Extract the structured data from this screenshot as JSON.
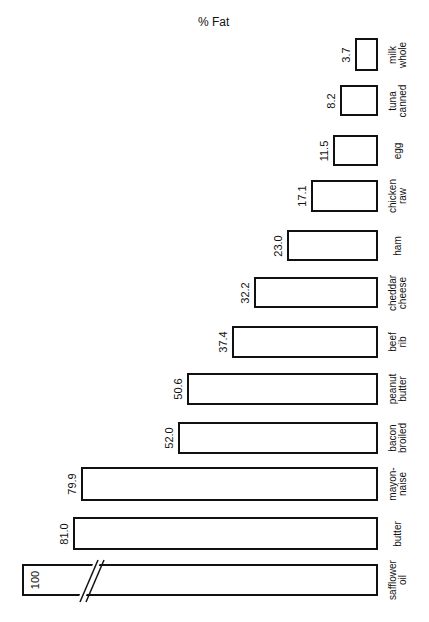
{
  "chart_data": {
    "type": "bar",
    "orientation": "horizontal-rotated",
    "title": "% Fat",
    "xlabel": "",
    "ylabel": "% Fat",
    "categories": [
      "milk whole",
      "tuna canned",
      "egg",
      "chicken raw",
      "ham",
      "cheddar cheese",
      "beef rib",
      "peanut butter",
      "bacon broiled",
      "mayon-naise",
      "butter",
      "safflower oil"
    ],
    "values": [
      3.7,
      8.2,
      11.5,
      17.1,
      23.0,
      32.2,
      37.4,
      50.6,
      52.0,
      79.9,
      81.0,
      100
    ],
    "value_labels": [
      "3.7",
      "8.2",
      "11.5",
      "17.1",
      "23.0",
      "32.2",
      "37.4",
      "50.6",
      "52.0",
      "79.9",
      "81.0",
      "100"
    ],
    "label_lines": [
      [
        "milk",
        "whole"
      ],
      [
        "tuna",
        "canned"
      ],
      [
        "egg"
      ],
      [
        "chicken",
        "raw"
      ],
      [
        "ham"
      ],
      [
        "cheddar",
        "cheese"
      ],
      [
        "beef",
        "rib"
      ],
      [
        "peanut",
        "butter"
      ],
      [
        "bacon",
        "broiled"
      ],
      [
        "mayon-",
        "naise"
      ],
      [
        "butter"
      ],
      [
        "safflower",
        "oil"
      ]
    ],
    "axis_break_on": "safflower oil",
    "grid": false,
    "legend": "none"
  },
  "bars": [
    {
      "label": "milk\nwhole",
      "value": "3.7",
      "left": 355,
      "top": 38,
      "height": 33
    },
    {
      "label": "tuna\ncanned",
      "value": "8.2",
      "left": 340,
      "top": 85,
      "height": 31
    },
    {
      "label": "egg",
      "value": "11.5",
      "left": 333,
      "top": 135,
      "height": 31
    },
    {
      "label": "chicken\nraw",
      "value": "17.1",
      "left": 311,
      "top": 180,
      "height": 32
    },
    {
      "label": "ham",
      "value": "23.0",
      "left": 287,
      "top": 230,
      "height": 31
    },
    {
      "label": "cheddar\ncheese",
      "value": "32.2",
      "left": 254,
      "top": 277,
      "height": 31
    },
    {
      "label": "beef\nrib",
      "value": "37.4",
      "left": 232,
      "top": 326,
      "height": 32
    },
    {
      "label": "peanut\nbutter",
      "value": "50.6",
      "left": 187,
      "top": 373,
      "height": 32
    },
    {
      "label": "bacon\nbroiled",
      "value": "52.0",
      "left": 178,
      "top": 422,
      "height": 32
    },
    {
      "label": "mayon-\nnaise",
      "value": "79.9",
      "left": 81,
      "top": 467,
      "height": 34
    },
    {
      "label": "butter",
      "value": "81.0",
      "left": 73,
      "top": 517,
      "height": 33
    },
    {
      "label": "safflower\noil",
      "value": "100",
      "left": 22,
      "top": 564,
      "height": 32
    }
  ]
}
